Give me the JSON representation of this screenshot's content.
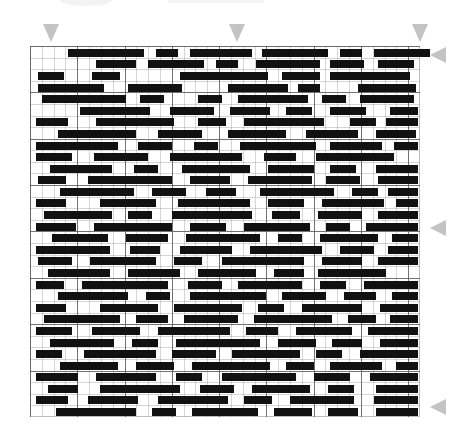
{
  "document": {
    "title": "Pattern Grid",
    "kind": "barcode-pattern-grid",
    "description": "Monochrome horizontal-bar pattern laid out on a ruled grid with gray alignment triangles on the top and right edges."
  },
  "colors": {
    "background": "#ffffff",
    "bar": "#111111",
    "grid_minor": "#96969b",
    "grid_major": "#5a5a5f",
    "grid_border": "#bdbdbd",
    "marker": "#b9b9bc"
  },
  "grid": {
    "left": 30,
    "top": 46,
    "width": 390,
    "height": 371,
    "columns": 33,
    "rows": 32,
    "cell_width": 11.818,
    "cell_height": 11.59,
    "major_every_columns": 4,
    "major_every_rows": 4
  },
  "markers": {
    "top": [
      {
        "name": "alignment-marker-top-1",
        "x": 43,
        "y": 24,
        "direction": "down"
      },
      {
        "name": "alignment-marker-top-2",
        "x": 229,
        "y": 24,
        "direction": "down"
      },
      {
        "name": "alignment-marker-top-3",
        "x": 412,
        "y": 24,
        "direction": "down"
      }
    ],
    "right": [
      {
        "name": "alignment-marker-right-1",
        "x": 430,
        "y": 47,
        "direction": "left"
      },
      {
        "name": "alignment-marker-right-2",
        "x": 430,
        "y": 220,
        "direction": "left"
      },
      {
        "name": "alignment-marker-right-3",
        "x": 430,
        "y": 399,
        "direction": "left"
      }
    ]
  },
  "bars": [
    {
      "row": 0,
      "x": 38,
      "w": 76
    },
    {
      "row": 0,
      "x": 126,
      "w": 22
    },
    {
      "row": 0,
      "x": 160,
      "w": 62
    },
    {
      "row": 0,
      "x": 232,
      "w": 66
    },
    {
      "row": 0,
      "x": 310,
      "w": 22
    },
    {
      "row": 0,
      "x": 344,
      "w": 56
    },
    {
      "row": 1,
      "x": 66,
      "w": 40
    },
    {
      "row": 1,
      "x": 118,
      "w": 56
    },
    {
      "row": 1,
      "x": 186,
      "w": 22
    },
    {
      "row": 1,
      "x": 226,
      "w": 64
    },
    {
      "row": 1,
      "x": 300,
      "w": 34
    },
    {
      "row": 1,
      "x": 348,
      "w": 36
    },
    {
      "row": 2,
      "x": 8,
      "w": 26
    },
    {
      "row": 2,
      "x": 62,
      "w": 28
    },
    {
      "row": 2,
      "x": 150,
      "w": 88
    },
    {
      "row": 2,
      "x": 252,
      "w": 38
    },
    {
      "row": 2,
      "x": 300,
      "w": 80
    },
    {
      "row": 3,
      "x": 8,
      "w": 66
    },
    {
      "row": 3,
      "x": 98,
      "w": 54
    },
    {
      "row": 3,
      "x": 198,
      "w": 60
    },
    {
      "row": 3,
      "x": 268,
      "w": 22
    },
    {
      "row": 3,
      "x": 328,
      "w": 58
    },
    {
      "row": 4,
      "x": 12,
      "w": 84
    },
    {
      "row": 4,
      "x": 110,
      "w": 24
    },
    {
      "row": 4,
      "x": 168,
      "w": 24
    },
    {
      "row": 4,
      "x": 208,
      "w": 70
    },
    {
      "row": 4,
      "x": 292,
      "w": 24
    },
    {
      "row": 4,
      "x": 330,
      "w": 54
    },
    {
      "row": 5,
      "x": 50,
      "w": 70
    },
    {
      "row": 5,
      "x": 140,
      "w": 44
    },
    {
      "row": 5,
      "x": 200,
      "w": 40
    },
    {
      "row": 5,
      "x": 256,
      "w": 26
    },
    {
      "row": 5,
      "x": 300,
      "w": 36
    },
    {
      "row": 5,
      "x": 360,
      "w": 28
    },
    {
      "row": 6,
      "x": 6,
      "w": 32
    },
    {
      "row": 6,
      "x": 66,
      "w": 78
    },
    {
      "row": 6,
      "x": 168,
      "w": 28
    },
    {
      "row": 6,
      "x": 214,
      "w": 80
    },
    {
      "row": 6,
      "x": 320,
      "w": 26
    },
    {
      "row": 6,
      "x": 356,
      "w": 32
    },
    {
      "row": 7,
      "x": 28,
      "w": 78
    },
    {
      "row": 7,
      "x": 128,
      "w": 44
    },
    {
      "row": 7,
      "x": 198,
      "w": 58
    },
    {
      "row": 7,
      "x": 276,
      "w": 52
    },
    {
      "row": 7,
      "x": 346,
      "w": 40
    },
    {
      "row": 8,
      "x": 6,
      "w": 82
    },
    {
      "row": 8,
      "x": 108,
      "w": 34
    },
    {
      "row": 8,
      "x": 164,
      "w": 24
    },
    {
      "row": 8,
      "x": 210,
      "w": 76
    },
    {
      "row": 8,
      "x": 300,
      "w": 52
    },
    {
      "row": 8,
      "x": 364,
      "w": 24
    },
    {
      "row": 9,
      "x": 6,
      "w": 36
    },
    {
      "row": 9,
      "x": 64,
      "w": 54
    },
    {
      "row": 9,
      "x": 140,
      "w": 72
    },
    {
      "row": 9,
      "x": 234,
      "w": 32
    },
    {
      "row": 9,
      "x": 286,
      "w": 78
    },
    {
      "row": 10,
      "x": 20,
      "w": 62
    },
    {
      "row": 10,
      "x": 104,
      "w": 24
    },
    {
      "row": 10,
      "x": 152,
      "w": 68
    },
    {
      "row": 10,
      "x": 238,
      "w": 46
    },
    {
      "row": 10,
      "x": 300,
      "w": 26
    },
    {
      "row": 10,
      "x": 346,
      "w": 42
    },
    {
      "row": 11,
      "x": 8,
      "w": 28
    },
    {
      "row": 11,
      "x": 58,
      "w": 84
    },
    {
      "row": 11,
      "x": 160,
      "w": 40
    },
    {
      "row": 11,
      "x": 218,
      "w": 64
    },
    {
      "row": 11,
      "x": 296,
      "w": 34
    },
    {
      "row": 11,
      "x": 348,
      "w": 40
    },
    {
      "row": 12,
      "x": 30,
      "w": 74
    },
    {
      "row": 12,
      "x": 122,
      "w": 34
    },
    {
      "row": 12,
      "x": 176,
      "w": 30
    },
    {
      "row": 12,
      "x": 230,
      "w": 74
    },
    {
      "row": 12,
      "x": 322,
      "w": 26
    },
    {
      "row": 12,
      "x": 358,
      "w": 30
    },
    {
      "row": 13,
      "x": 6,
      "w": 30
    },
    {
      "row": 13,
      "x": 70,
      "w": 56
    },
    {
      "row": 13,
      "x": 148,
      "w": 72
    },
    {
      "row": 13,
      "x": 238,
      "w": 36
    },
    {
      "row": 13,
      "x": 292,
      "w": 62
    },
    {
      "row": 13,
      "x": 366,
      "w": 22
    },
    {
      "row": 14,
      "x": 14,
      "w": 68
    },
    {
      "row": 14,
      "x": 98,
      "w": 24
    },
    {
      "row": 14,
      "x": 142,
      "w": 80
    },
    {
      "row": 14,
      "x": 242,
      "w": 28
    },
    {
      "row": 14,
      "x": 288,
      "w": 44
    },
    {
      "row": 14,
      "x": 348,
      "w": 40
    },
    {
      "row": 15,
      "x": 6,
      "w": 40
    },
    {
      "row": 15,
      "x": 64,
      "w": 78
    },
    {
      "row": 15,
      "x": 160,
      "w": 36
    },
    {
      "row": 15,
      "x": 214,
      "w": 66
    },
    {
      "row": 15,
      "x": 296,
      "w": 24
    },
    {
      "row": 15,
      "x": 336,
      "w": 52
    },
    {
      "row": 16,
      "x": 22,
      "w": 56
    },
    {
      "row": 16,
      "x": 96,
      "w": 42
    },
    {
      "row": 16,
      "x": 156,
      "w": 74
    },
    {
      "row": 16,
      "x": 248,
      "w": 24
    },
    {
      "row": 16,
      "x": 290,
      "w": 58
    },
    {
      "row": 16,
      "x": 362,
      "w": 26
    },
    {
      "row": 17,
      "x": 6,
      "w": 74
    },
    {
      "row": 17,
      "x": 100,
      "w": 30
    },
    {
      "row": 17,
      "x": 150,
      "w": 52
    },
    {
      "row": 17,
      "x": 220,
      "w": 72
    },
    {
      "row": 17,
      "x": 310,
      "w": 34
    },
    {
      "row": 17,
      "x": 358,
      "w": 30
    },
    {
      "row": 18,
      "x": 8,
      "w": 34
    },
    {
      "row": 18,
      "x": 60,
      "w": 66
    },
    {
      "row": 18,
      "x": 144,
      "w": 28
    },
    {
      "row": 18,
      "x": 192,
      "w": 82
    },
    {
      "row": 18,
      "x": 292,
      "w": 40
    },
    {
      "row": 18,
      "x": 348,
      "w": 40
    },
    {
      "row": 19,
      "x": 18,
      "w": 62
    },
    {
      "row": 19,
      "x": 98,
      "w": 52
    },
    {
      "row": 19,
      "x": 168,
      "w": 58
    },
    {
      "row": 19,
      "x": 244,
      "w": 30
    },
    {
      "row": 19,
      "x": 288,
      "w": 68
    },
    {
      "row": 20,
      "x": 6,
      "w": 28
    },
    {
      "row": 20,
      "x": 52,
      "w": 86
    },
    {
      "row": 20,
      "x": 158,
      "w": 34
    },
    {
      "row": 20,
      "x": 208,
      "w": 64
    },
    {
      "row": 20,
      "x": 290,
      "w": 26
    },
    {
      "row": 20,
      "x": 334,
      "w": 54
    },
    {
      "row": 21,
      "x": 28,
      "w": 70
    },
    {
      "row": 21,
      "x": 116,
      "w": 24
    },
    {
      "row": 21,
      "x": 160,
      "w": 76
    },
    {
      "row": 21,
      "x": 252,
      "w": 44
    },
    {
      "row": 21,
      "x": 314,
      "w": 32
    },
    {
      "row": 21,
      "x": 362,
      "w": 26
    },
    {
      "row": 22,
      "x": 6,
      "w": 30
    },
    {
      "row": 22,
      "x": 70,
      "w": 58
    },
    {
      "row": 22,
      "x": 144,
      "w": 68
    },
    {
      "row": 22,
      "x": 228,
      "w": 26
    },
    {
      "row": 22,
      "x": 272,
      "w": 60
    },
    {
      "row": 22,
      "x": 350,
      "w": 38
    },
    {
      "row": 23,
      "x": 14,
      "w": 76
    },
    {
      "row": 23,
      "x": 106,
      "w": 32
    },
    {
      "row": 23,
      "x": 154,
      "w": 54
    },
    {
      "row": 23,
      "x": 224,
      "w": 78
    },
    {
      "row": 23,
      "x": 318,
      "w": 28
    },
    {
      "row": 23,
      "x": 360,
      "w": 28
    },
    {
      "row": 24,
      "x": 6,
      "w": 36
    },
    {
      "row": 24,
      "x": 62,
      "w": 48
    },
    {
      "row": 24,
      "x": 128,
      "w": 72
    },
    {
      "row": 24,
      "x": 216,
      "w": 32
    },
    {
      "row": 24,
      "x": 266,
      "w": 56
    },
    {
      "row": 24,
      "x": 338,
      "w": 50
    },
    {
      "row": 25,
      "x": 20,
      "w": 64
    },
    {
      "row": 25,
      "x": 102,
      "w": 26
    },
    {
      "row": 25,
      "x": 146,
      "w": 84
    },
    {
      "row": 25,
      "x": 248,
      "w": 38
    },
    {
      "row": 25,
      "x": 302,
      "w": 30
    },
    {
      "row": 25,
      "x": 350,
      "w": 38
    },
    {
      "row": 26,
      "x": 6,
      "w": 26
    },
    {
      "row": 26,
      "x": 54,
      "w": 72
    },
    {
      "row": 26,
      "x": 142,
      "w": 44
    },
    {
      "row": 26,
      "x": 202,
      "w": 68
    },
    {
      "row": 26,
      "x": 286,
      "w": 26
    },
    {
      "row": 26,
      "x": 330,
      "w": 58
    },
    {
      "row": 27,
      "x": 30,
      "w": 58
    },
    {
      "row": 27,
      "x": 106,
      "w": 38
    },
    {
      "row": 27,
      "x": 162,
      "w": 78
    },
    {
      "row": 27,
      "x": 256,
      "w": 28
    },
    {
      "row": 27,
      "x": 300,
      "w": 52
    },
    {
      "row": 27,
      "x": 366,
      "w": 22
    },
    {
      "row": 28,
      "x": 6,
      "w": 42
    },
    {
      "row": 28,
      "x": 66,
      "w": 60
    },
    {
      "row": 28,
      "x": 146,
      "w": 26
    },
    {
      "row": 28,
      "x": 192,
      "w": 74
    },
    {
      "row": 28,
      "x": 284,
      "w": 36
    },
    {
      "row": 28,
      "x": 340,
      "w": 48
    },
    {
      "row": 29,
      "x": 18,
      "w": 30
    },
    {
      "row": 29,
      "x": 70,
      "w": 80
    },
    {
      "row": 29,
      "x": 170,
      "w": 34
    },
    {
      "row": 29,
      "x": 222,
      "w": 58
    },
    {
      "row": 29,
      "x": 298,
      "w": 26
    },
    {
      "row": 29,
      "x": 346,
      "w": 42
    },
    {
      "row": 30,
      "x": 6,
      "w": 32
    },
    {
      "row": 30,
      "x": 58,
      "w": 50
    },
    {
      "row": 30,
      "x": 128,
      "w": 70
    },
    {
      "row": 30,
      "x": 214,
      "w": 28
    },
    {
      "row": 30,
      "x": 260,
      "w": 64
    },
    {
      "row": 30,
      "x": 344,
      "w": 44
    },
    {
      "row": 31,
      "x": 26,
      "w": 80
    },
    {
      "row": 31,
      "x": 122,
      "w": 24
    },
    {
      "row": 31,
      "x": 162,
      "w": 66
    },
    {
      "row": 31,
      "x": 244,
      "w": 38
    },
    {
      "row": 31,
      "x": 298,
      "w": 30
    },
    {
      "row": 31,
      "x": 346,
      "w": 42
    }
  ]
}
